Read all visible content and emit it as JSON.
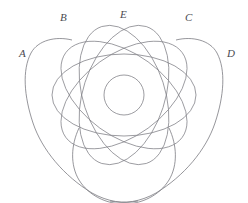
{
  "figure": {
    "background_color": "#ffffff",
    "stroke_color": "#7b7b82",
    "label_color": "#4a4a50",
    "width": 248,
    "height": 203,
    "center": {
      "x": 124,
      "y": 95
    }
  },
  "labels": [
    {
      "id": "A",
      "text": "A",
      "x": 19,
      "y": 48
    },
    {
      "id": "B",
      "text": "B",
      "x": 60,
      "y": 12
    },
    {
      "id": "E",
      "text": "E",
      "x": 120,
      "y": 9
    },
    {
      "id": "C",
      "text": "C",
      "x": 185,
      "y": 12
    },
    {
      "id": "D",
      "text": "D",
      "x": 227,
      "y": 48
    }
  ],
  "shapes": {
    "central_circle": {
      "cx": 124,
      "cy": 95,
      "r": 20
    },
    "ellipses": [
      {
        "id": "ellipse-0",
        "rx": 72,
        "ry": 41,
        "rotation": 0
      },
      {
        "id": "ellipse-36",
        "rx": 72,
        "ry": 41,
        "rotation": 36
      },
      {
        "id": "ellipse-72",
        "rx": 72,
        "ry": 41,
        "rotation": 72
      },
      {
        "id": "ellipse-108",
        "rx": 72,
        "ry": 41,
        "rotation": 108
      },
      {
        "id": "ellipse-144",
        "rx": 72,
        "ry": 41,
        "rotation": 144
      }
    ],
    "outer_lobes": [
      {
        "id": "lobe-left",
        "anchor_label": "A"
      },
      {
        "id": "lobe-right",
        "anchor_label": "D"
      },
      {
        "id": "lobe-bottom",
        "anchor_label": ""
      }
    ]
  }
}
